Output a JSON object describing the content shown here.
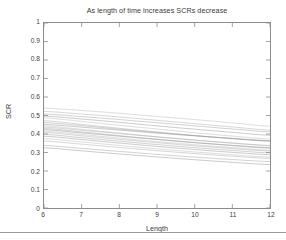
{
  "figure": {
    "width": 286,
    "height": 240,
    "background": "#ffffff",
    "axis_color": "#8c8c8c",
    "text_color": "#3a3a3a",
    "line_color": "#8d8d8d"
  },
  "chart_data": {
    "type": "line",
    "title": "As length of time increases SCRs decrease",
    "xlabel": "Length",
    "ylabel": "SCR",
    "xlim": [
      6,
      12
    ],
    "ylim": [
      0,
      1
    ],
    "xticks": [
      6,
      7,
      8,
      9,
      10,
      11,
      12
    ],
    "xtick_labels": [
      "6",
      "7",
      "8",
      "9",
      "10",
      "11",
      "12"
    ],
    "yticks": [
      0,
      0.1,
      0.2,
      0.3,
      0.4,
      0.5,
      0.6,
      0.7,
      0.8,
      0.9,
      1
    ],
    "ytick_labels": [
      "0",
      "0.1",
      "0.2",
      "0.3",
      "0.4",
      "0.5",
      "0.6",
      "0.7",
      "0.8",
      "0.9",
      "1"
    ],
    "grid": false,
    "legend": null,
    "x": [
      6,
      7,
      8,
      9,
      10,
      11,
      12
    ],
    "series": [
      {
        "name": "curve-01",
        "values": [
          0.54,
          0.527,
          0.512,
          0.495,
          0.478,
          0.46,
          0.442
        ]
      },
      {
        "name": "curve-02",
        "values": [
          0.522,
          0.508,
          0.492,
          0.474,
          0.456,
          0.438,
          0.421
        ]
      },
      {
        "name": "curve-03",
        "values": [
          0.508,
          0.494,
          0.478,
          0.461,
          0.444,
          0.427,
          0.412
        ]
      },
      {
        "name": "curve-04",
        "values": [
          0.497,
          0.481,
          0.463,
          0.444,
          0.426,
          0.409,
          0.393
        ]
      },
      {
        "name": "curve-05",
        "values": [
          0.487,
          0.468,
          0.447,
          0.427,
          0.407,
          0.389,
          0.373
        ]
      },
      {
        "name": "curve-06",
        "values": [
          0.472,
          0.452,
          0.431,
          0.411,
          0.392,
          0.375,
          0.36
        ]
      },
      {
        "name": "curve-07",
        "values": [
          0.462,
          0.445,
          0.426,
          0.408,
          0.391,
          0.376,
          0.362
        ]
      },
      {
        "name": "curve-08",
        "values": [
          0.452,
          0.437,
          0.421,
          0.405,
          0.39,
          0.376,
          0.364
        ]
      },
      {
        "name": "curve-09",
        "values": [
          0.444,
          0.425,
          0.405,
          0.385,
          0.367,
          0.35,
          0.336
        ]
      },
      {
        "name": "curve-10",
        "values": [
          0.437,
          0.42,
          0.402,
          0.384,
          0.367,
          0.352,
          0.338
        ]
      },
      {
        "name": "curve-11",
        "values": [
          0.43,
          0.411,
          0.391,
          0.371,
          0.353,
          0.337,
          0.323
        ]
      },
      {
        "name": "curve-12",
        "values": [
          0.423,
          0.406,
          0.388,
          0.371,
          0.354,
          0.339,
          0.326
        ]
      },
      {
        "name": "curve-13",
        "values": [
          0.415,
          0.397,
          0.378,
          0.359,
          0.342,
          0.326,
          0.312
        ]
      },
      {
        "name": "curve-14",
        "values": [
          0.408,
          0.39,
          0.371,
          0.353,
          0.336,
          0.321,
          0.308
        ]
      },
      {
        "name": "curve-15",
        "values": [
          0.398,
          0.38,
          0.361,
          0.343,
          0.326,
          0.311,
          0.298
        ]
      },
      {
        "name": "curve-16",
        "values": [
          0.388,
          0.37,
          0.351,
          0.333,
          0.316,
          0.301,
          0.288
        ]
      },
      {
        "name": "curve-17",
        "values": [
          0.375,
          0.357,
          0.338,
          0.32,
          0.303,
          0.288,
          0.275
        ]
      },
      {
        "name": "curve-18",
        "values": [
          0.362,
          0.345,
          0.327,
          0.31,
          0.294,
          0.28,
          0.268
        ]
      },
      {
        "name": "curve-19",
        "values": [
          0.338,
          0.322,
          0.306,
          0.29,
          0.275,
          0.262,
          0.251
        ]
      },
      {
        "name": "curve-20",
        "values": [
          0.325,
          0.309,
          0.292,
          0.276,
          0.261,
          0.247,
          0.235
        ]
      }
    ]
  }
}
